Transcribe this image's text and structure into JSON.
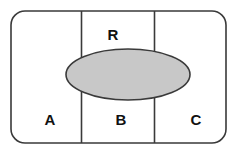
{
  "diagram": {
    "type": "set-diagram",
    "background_color": "#ffffff",
    "stroke_color": "#3a3a3a",
    "stroke_width": 1.6,
    "universe": {
      "shape": "rounded-rectangle",
      "x": 11,
      "y": 11,
      "width": 215,
      "height": 132,
      "corner_radius": 14,
      "fill": "#ffffff"
    },
    "dividers": [
      {
        "id": "divider-1",
        "orientation": "vertical",
        "x": 81.5,
        "y1": 11,
        "y2": 143
      },
      {
        "id": "divider-2",
        "orientation": "vertical",
        "x": 154.5,
        "y1": 11,
        "y2": 143
      }
    ],
    "ellipse": {
      "id": "set-r",
      "cx": 128,
      "cy": 74.5,
      "rx": 62,
      "ry": 25.5,
      "fill": "#c8c8c8",
      "stroke": "#3a3a3a"
    },
    "labels": [
      {
        "id": "label-r",
        "text": "R",
        "x": 113,
        "y": 36
      },
      {
        "id": "label-a",
        "text": "A",
        "x": 50,
        "y": 121
      },
      {
        "id": "label-b",
        "text": "B",
        "x": 121,
        "y": 121
      },
      {
        "id": "label-c",
        "text": "C",
        "x": 196,
        "y": 121
      }
    ]
  }
}
